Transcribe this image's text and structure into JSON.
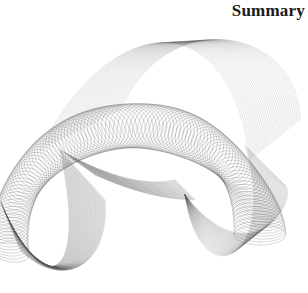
{
  "page": {
    "heading": "Summary"
  },
  "artwork": {
    "description": "abstract twisted wireframe ribbon illustration",
    "stroke_color": "#555555"
  }
}
